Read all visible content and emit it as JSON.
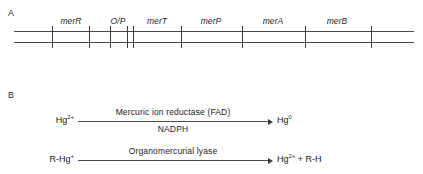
{
  "figure": {
    "panels": [
      {
        "letter": "A",
        "kind": "gene-map"
      },
      {
        "letter": "B",
        "kind": "reaction-scheme"
      }
    ]
  },
  "panel_a": {
    "letter": "A",
    "map": {
      "ticks_px": [
        38,
        75,
        96,
        113,
        119,
        167,
        228,
        291,
        357
      ],
      "rail_color": "#4a4a4a"
    },
    "genes": [
      {
        "label": "merR",
        "center_px": 57
      },
      {
        "label": "O/P",
        "center_px": 104
      },
      {
        "label": "merT",
        "center_px": 143
      },
      {
        "label": "merP",
        "center_px": 197
      },
      {
        "label": "merA",
        "center_px": 259
      },
      {
        "label": "merB",
        "center_px": 323
      }
    ]
  },
  "panel_b": {
    "letter": "B",
    "reactions": [
      {
        "substrate": "Hg",
        "substrate_sup": "2+",
        "product": "Hg",
        "product_sup": "0",
        "product_suffix": "",
        "enzyme_above": "Mercuric ion reductase (FAD)",
        "cofactor_below": "NADPH"
      },
      {
        "substrate": "R-Hg",
        "substrate_sup": "+",
        "product": "Hg",
        "product_sup": "2+",
        "product_suffix": " + R-H",
        "enzyme_above": "Organomercurial lyase",
        "cofactor_below": ""
      }
    ]
  },
  "colors": {
    "ink": "#1a1a1a",
    "line": "#4a4a4a",
    "background": "#ffffff"
  }
}
